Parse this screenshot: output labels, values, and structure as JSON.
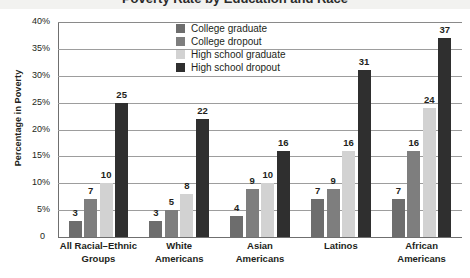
{
  "figure": {
    "clipped_title": "Poverty Rate by Education and Race",
    "y_axis_title": "Percentage in Poverty",
    "zero_label": "0"
  },
  "legend": {
    "items": [
      {
        "label": "College graduate",
        "color": "#6d6d6d"
      },
      {
        "label": "College dropout",
        "color": "#7e7e7e"
      },
      {
        "label": "High school graduate",
        "color": "#d2d2d2"
      },
      {
        "label": "High school dropout",
        "color": "#2f2f2f"
      }
    ]
  },
  "chart_data": {
    "type": "bar",
    "title": "Poverty Rate by Education and Race",
    "xlabel": "",
    "ylabel": "Percentage in Poverty",
    "ylim": [
      0,
      40
    ],
    "ytick_labels": [
      "0",
      "5%",
      "10%",
      "15%",
      "20%",
      "25%",
      "30%",
      "35%",
      "40%"
    ],
    "ytick_values": [
      0,
      5,
      10,
      15,
      20,
      25,
      30,
      35,
      40
    ],
    "grid": true,
    "legend_position": "top-center",
    "value_labels": true,
    "categories": [
      "All Racial–Ethnic\nGroups",
      "White\nAmericans",
      "Asian\nAmericans",
      "Latinos",
      "African\nAmericans"
    ],
    "series": [
      {
        "name": "College graduate",
        "color": "#6d6d6d",
        "values": [
          3,
          3,
          4,
          7,
          7
        ]
      },
      {
        "name": "College dropout",
        "color": "#7e7e7e",
        "values": [
          7,
          5,
          9,
          9,
          16
        ]
      },
      {
        "name": "High school graduate",
        "color": "#d2d2d2",
        "values": [
          10,
          8,
          10,
          16,
          24
        ]
      },
      {
        "name": "High school dropout",
        "color": "#2f2f2f",
        "values": [
          25,
          22,
          16,
          31,
          37
        ]
      }
    ]
  }
}
